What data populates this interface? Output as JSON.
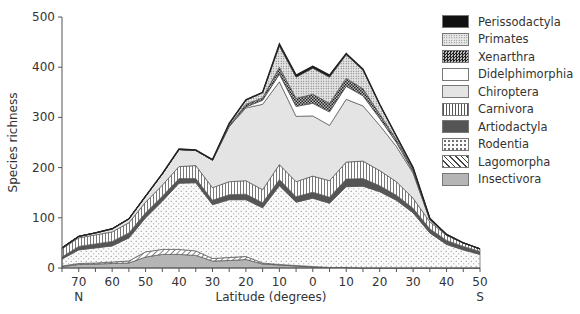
{
  "chart_data": {
    "type": "area",
    "stacked": true,
    "title": "",
    "xlabel": "Latitude (degrees)",
    "ylabel": "Species richness",
    "ylim": [
      0,
      500
    ],
    "yticks": [
      0,
      100,
      200,
      300,
      400,
      500
    ],
    "x_tick_labels": [
      "70",
      "60",
      "50",
      "40",
      "30",
      "20",
      "10",
      "0",
      "10",
      "20",
      "30",
      "40",
      "50"
    ],
    "x_hemisphere_labels": {
      "north": "N",
      "south": "S"
    },
    "x_latitudes": [
      75,
      70,
      65,
      60,
      55,
      50,
      45,
      40,
      35,
      30,
      25,
      20,
      15,
      10,
      5,
      0,
      -5,
      -10,
      -15,
      -20,
      -25,
      -30,
      -35,
      -40,
      -45,
      -50
    ],
    "categories": [
      "75N",
      "70N",
      "65N",
      "60N",
      "55N",
      "50N",
      "45N",
      "40N",
      "35N",
      "30N",
      "25N",
      "20N",
      "15N",
      "10N",
      "5N",
      "0",
      "5S",
      "10S",
      "15S",
      "20S",
      "25S",
      "30S",
      "35S",
      "40S",
      "45S",
      "50S"
    ],
    "series": [
      {
        "name": "Insectivora",
        "pattern": "gray-solid",
        "values": [
          3,
          7,
          8,
          9,
          10,
          22,
          27,
          27,
          25,
          14,
          15,
          17,
          8,
          6,
          4,
          2,
          1,
          1,
          0,
          0,
          0,
          0,
          0,
          0,
          0,
          0
        ]
      },
      {
        "name": "Lagomorpha",
        "pattern": "diagonal",
        "values": [
          1,
          2,
          2,
          3,
          4,
          10,
          10,
          10,
          9,
          5,
          6,
          6,
          2,
          1,
          1,
          1,
          0,
          0,
          0,
          0,
          0,
          0,
          0,
          0,
          0,
          0
        ]
      },
      {
        "name": "Rodentia",
        "pattern": "dots",
        "values": [
          14,
          27,
          30,
          32,
          46,
          68,
          96,
          132,
          136,
          107,
          115,
          113,
          110,
          157,
          126,
          136,
          128,
          161,
          163,
          152,
          135,
          110,
          70,
          47,
          36,
          27
        ]
      },
      {
        "name": "Artiodactyla",
        "pattern": "dark-gray",
        "values": [
          4,
          7,
          8,
          9,
          10,
          10,
          10,
          9,
          8,
          9,
          10,
          11,
          10,
          12,
          11,
          12,
          12,
          15,
          15,
          12,
          10,
          9,
          8,
          8,
          7,
          6
        ]
      },
      {
        "name": "Carnivora",
        "pattern": "vertical",
        "values": [
          16,
          17,
          18,
          19,
          20,
          21,
          22,
          24,
          26,
          25,
          26,
          27,
          26,
          30,
          30,
          32,
          33,
          34,
          35,
          30,
          27,
          20,
          14,
          10,
          7,
          5
        ]
      },
      {
        "name": "Chiroptera",
        "pattern": "light-gray",
        "values": [
          2,
          3,
          4,
          6,
          8,
          12,
          22,
          34,
          30,
          55,
          110,
          145,
          170,
          165,
          130,
          120,
          110,
          125,
          110,
          90,
          70,
          50,
          4,
          1,
          0,
          0
        ]
      },
      {
        "name": "Didelphimorphia",
        "pattern": "white",
        "values": [
          0,
          0,
          0,
          0,
          0,
          0,
          0,
          0,
          0,
          0,
          0,
          2,
          8,
          15,
          20,
          25,
          27,
          26,
          20,
          14,
          8,
          3,
          1,
          0,
          0,
          0
        ]
      },
      {
        "name": "Xenarthra",
        "pattern": "checker",
        "values": [
          0,
          0,
          0,
          0,
          0,
          0,
          0,
          0,
          0,
          0,
          2,
          5,
          5,
          14,
          16,
          18,
          17,
          16,
          14,
          9,
          6,
          4,
          2,
          1,
          0,
          0
        ]
      },
      {
        "name": "Primates",
        "pattern": "fine-grid",
        "values": [
          0,
          0,
          0,
          0,
          0,
          0,
          0,
          0,
          0,
          0,
          3,
          8,
          10,
          42,
          42,
          52,
          52,
          47,
          37,
          18,
          6,
          3,
          0,
          0,
          0,
          0
        ]
      },
      {
        "name": "Perissodactyla",
        "pattern": "black",
        "values": [
          0,
          0,
          0,
          0,
          0,
          0,
          1,
          1,
          1,
          1,
          1,
          1,
          1,
          4,
          4,
          4,
          4,
          2,
          2,
          1,
          1,
          1,
          0,
          0,
          0,
          0
        ]
      }
    ],
    "legend": [
      "Perissodactyla",
      "Primates",
      "Xenarthra",
      "Didelphimorphia",
      "Chiroptera",
      "Carnivora",
      "Artiodactyla",
      "Rodentia",
      "Lagomorpha",
      "Insectivora"
    ],
    "legend_position": "top-right",
    "grid": false
  },
  "legend": {
    "items": [
      {
        "label": "Perissodactyla"
      },
      {
        "label": "Primates"
      },
      {
        "label": "Xenarthra"
      },
      {
        "label": "Didelphimorphia"
      },
      {
        "label": "Chiroptera"
      },
      {
        "label": "Carnivora"
      },
      {
        "label": "Artiodactyla"
      },
      {
        "label": "Rodentia"
      },
      {
        "label": "Lagomorpha"
      },
      {
        "label": "Insectivora"
      }
    ]
  },
  "axes": {
    "ylabel": "Species richness",
    "xlabel": "Latitude (degrees)",
    "north": "N",
    "south": "S"
  }
}
